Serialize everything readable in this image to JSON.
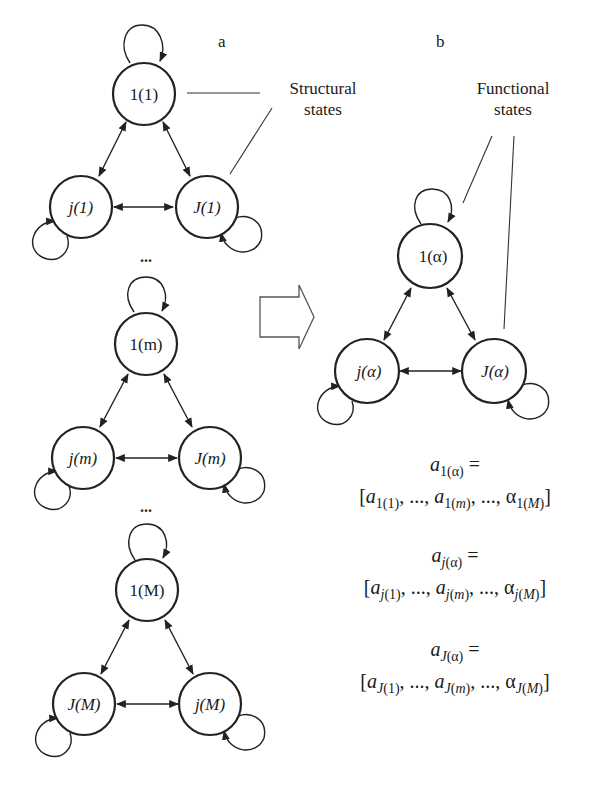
{
  "panels": {
    "a_label": "a",
    "b_label": "b"
  },
  "annotations": {
    "structural": {
      "line1": "Structural",
      "line2": "states"
    },
    "functional": {
      "line1": "Functional",
      "line2": "states"
    }
  },
  "ellipsis": "...",
  "graphs": {
    "g1": {
      "top": "1(1)",
      "left": "j(1)",
      "right": "J(1)"
    },
    "gm": {
      "top": "1(m)",
      "left": "j(m)",
      "right": "J(m)"
    },
    "gM": {
      "top": "1(M)",
      "left": "J(M)",
      "right": "j(M)"
    },
    "galpha": {
      "top": "1(α)",
      "left": "j(α)",
      "right": "J(α)"
    }
  },
  "formulas": [
    {
      "lhs": "a1(α) =",
      "rhs": "[a1(1), ..., a1(m), ..., α1(M)]"
    },
    {
      "lhs": "aj(α) =",
      "rhs": "[aj(1), ..., aj(m), ..., αj(M)]"
    },
    {
      "lhs": "aJ(α) =",
      "rhs": "[aJ(1), ..., aJ(m), ..., αJ(M)]"
    }
  ],
  "icons": {
    "transition_arrow": "hollow-right-arrow"
  }
}
